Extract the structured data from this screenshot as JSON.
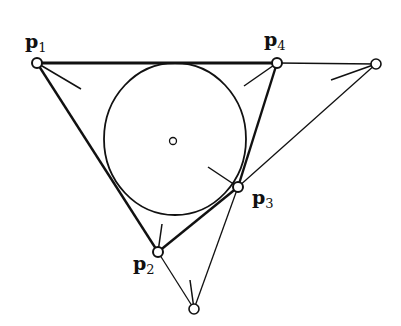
{
  "diagram": {
    "type": "geometric construction",
    "labels": {
      "p1": {
        "base": "p",
        "sub": "1"
      },
      "p2": {
        "base": "p",
        "sub": "2"
      },
      "p3": {
        "base": "p",
        "sub": "3"
      },
      "p4": {
        "base": "p",
        "sub": "4"
      }
    },
    "points": {
      "p1": [
        37,
        63
      ],
      "p4": [
        277,
        63
      ],
      "right_extra": [
        376,
        64
      ],
      "p3": [
        238,
        187
      ],
      "p2": [
        158,
        252
      ],
      "bottom_extra": [
        194,
        309
      ],
      "center": [
        173,
        141
      ]
    },
    "circle": {
      "cx": 175,
      "cy": 139,
      "rx": 71,
      "ry": 76
    },
    "colors": {
      "stroke": "#111111",
      "background": "#ffffff"
    }
  }
}
